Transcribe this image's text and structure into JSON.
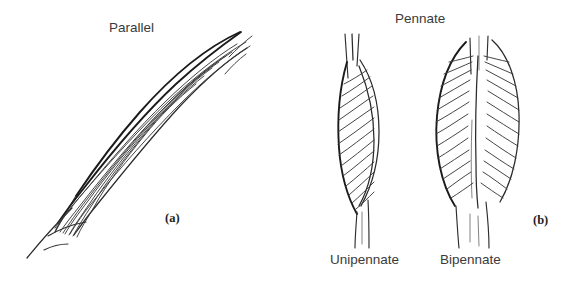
{
  "figure": {
    "title_parallel": "Parallel",
    "title_pennate": "Pennate",
    "panel_a": "(a)",
    "panel_b": "(b)",
    "sub_unipennate": "Unipennate",
    "sub_bipennate": "Bipennate"
  },
  "style": {
    "background": "#ffffff",
    "outline_color": "#1b1b1b",
    "fiber_color": "#3b3b3b",
    "label_color": "#3a3a3a",
    "panel_label_color": "#1d1d1d"
  },
  "diagram_data": {
    "type": "line-art-anatomical-diagram",
    "subject": "skeletal muscle fiber architecture",
    "panels": [
      {
        "id": "(a)",
        "heading": "Parallel",
        "shapes": [
          {
            "name": "parallel-muscle",
            "description": "elongated fusiform muscle belly oriented diagonally from lower-left to upper-right, with long fibers running the full length of the belly parallel to the line of pull, tapering to tendons at both ends",
            "fiber_count": 9,
            "orientation_degrees": 38
          }
        ]
      },
      {
        "id": "(b)",
        "heading": "Pennate",
        "shapes": [
          {
            "name": "unipennate-muscle",
            "label": "Unipennate",
            "description": "vertical spindle belly with short oblique fibers attaching at an angle to one side of a single longitudinal tendon",
            "fiber_count": 13,
            "tendon_sides": 1
          },
          {
            "name": "bipennate-muscle",
            "label": "Bipennate",
            "description": "vertical belly with oblique fibers converging from both sides onto a central longitudinal tendon, producing a feather-like pattern",
            "fiber_count": 22,
            "tendon_sides": 2
          }
        ]
      }
    ]
  }
}
